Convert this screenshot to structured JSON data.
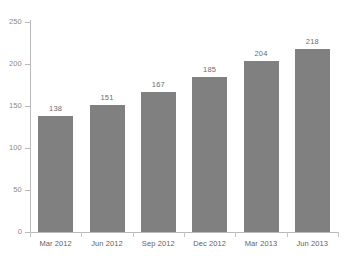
{
  "chart_data": {
    "type": "bar",
    "title": "",
    "subtitle": "",
    "xlabel": "",
    "ylabel": "",
    "categories": [
      "Mar 2012",
      "Jun 2012",
      "Sep 2012",
      "Dec 2012",
      "Mar 2013",
      "Jun 2013"
    ],
    "values": [
      138,
      151,
      167,
      185,
      204,
      218
    ],
    "value_labels": [
      "138",
      "151",
      "167",
      "185",
      "204",
      "218"
    ],
    "ylim": [
      0,
      250
    ],
    "y_ticks": [
      0,
      50,
      100,
      150,
      200,
      250
    ],
    "y_tick_labels": [
      "0",
      "50",
      "100",
      "150",
      "200",
      "250"
    ],
    "grid": false,
    "legend": null,
    "legend_position": "none",
    "bar_color": "#808080",
    "axis_color": "#b9b9b9",
    "label_color": "#6e6e6e",
    "background_color": "#ffffff"
  }
}
